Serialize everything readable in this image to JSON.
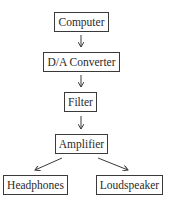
{
  "diagram": {
    "type": "flowchart",
    "nodes": [
      {
        "id": "computer",
        "label": "Computer"
      },
      {
        "id": "da_converter",
        "label": "D/A Converter"
      },
      {
        "id": "filter",
        "label": "Filter"
      },
      {
        "id": "amplifier",
        "label": "Amplifier"
      },
      {
        "id": "headphones",
        "label": "Headphones"
      },
      {
        "id": "loudspeaker",
        "label": "Loudspeaker"
      }
    ],
    "edges": [
      {
        "from": "computer",
        "to": "da_converter"
      },
      {
        "from": "da_converter",
        "to": "filter"
      },
      {
        "from": "filter",
        "to": "amplifier"
      },
      {
        "from": "amplifier",
        "to": "headphones"
      },
      {
        "from": "amplifier",
        "to": "loudspeaker"
      }
    ]
  }
}
